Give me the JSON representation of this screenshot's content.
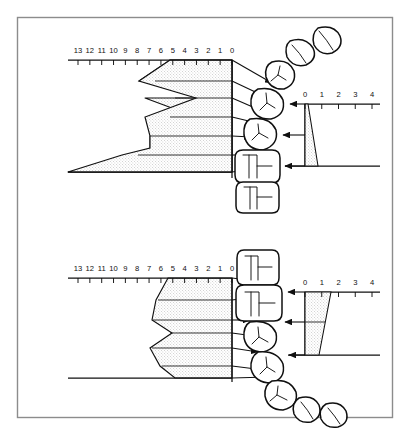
{
  "figure": {
    "border_color": "#8c8c8c",
    "ink_color": "#101010",
    "stipple_fill": "#d8d8d8"
  },
  "panels": [
    {
      "id": "upper-panel",
      "name": "Upper arch panel",
      "left_scale": {
        "name": "millimetre-scale-left-upper",
        "labels": [
          "13",
          "12",
          "11",
          "10",
          "9",
          "8",
          "7",
          "6",
          "5",
          "4",
          "3",
          "2",
          "1",
          "0"
        ],
        "values": [
          13,
          12,
          11,
          10,
          9,
          8,
          7,
          6,
          5,
          4,
          3,
          2,
          1,
          0
        ],
        "unit": "mm",
        "direction": "descending-left-to-right"
      },
      "right_scale": {
        "name": "millimetre-scale-right-upper",
        "labels": [
          "0",
          "1",
          "2",
          "3",
          "4"
        ],
        "values": [
          0,
          1,
          2,
          3,
          4
        ],
        "unit": "mm",
        "direction": "ascending-left-to-right"
      },
      "teeth": [
        {
          "name": "incisor-distal",
          "type": "incisor"
        },
        {
          "name": "incisor-mesial",
          "type": "incisor"
        },
        {
          "name": "canine",
          "type": "canine"
        },
        {
          "name": "first-premolar",
          "type": "premolar"
        },
        {
          "name": "second-premolar",
          "type": "premolar"
        },
        {
          "name": "first-molar",
          "type": "molar"
        },
        {
          "name": "second-molar",
          "type": "molar"
        }
      ],
      "arrow_count": 7,
      "wedge_right": {
        "name": "right-discrepancy-wedge-upper",
        "top_mm": 0.15,
        "bottom_mm": 1.5
      }
    },
    {
      "id": "lower-panel",
      "name": "Lower arch panel",
      "left_scale": {
        "name": "millimetre-scale-left-lower",
        "labels": [
          "13",
          "12",
          "11",
          "10",
          "9",
          "8",
          "7",
          "6",
          "5",
          "4",
          "3",
          "2",
          "1",
          "0"
        ],
        "values": [
          13,
          12,
          11,
          10,
          9,
          8,
          7,
          6,
          5,
          4,
          3,
          2,
          1,
          0
        ],
        "unit": "mm",
        "direction": "descending-left-to-right"
      },
      "right_scale": {
        "name": "millimetre-scale-right-lower",
        "labels": [
          "0",
          "1",
          "2",
          "3",
          "4"
        ],
        "values": [
          0,
          1,
          2,
          3,
          4
        ],
        "unit": "mm",
        "direction": "ascending-left-to-right"
      },
      "teeth": [
        {
          "name": "second-molar",
          "type": "molar"
        },
        {
          "name": "first-molar",
          "type": "molar"
        },
        {
          "name": "second-premolar",
          "type": "premolar"
        },
        {
          "name": "first-premolar",
          "type": "premolar"
        },
        {
          "name": "canine",
          "type": "canine"
        },
        {
          "name": "incisor-mesial",
          "type": "incisor"
        },
        {
          "name": "incisor-distal",
          "type": "incisor"
        }
      ],
      "arrow_count": 7,
      "wedge_right": {
        "name": "right-discrepancy-wedge-lower",
        "top_mm": 2.0,
        "bottom_mm": 1.3
      }
    }
  ]
}
